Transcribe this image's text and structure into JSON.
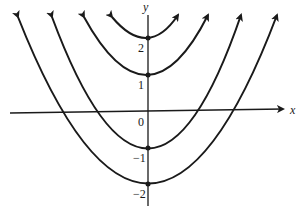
{
  "figure": {
    "axes": {
      "x_label": "x",
      "y_label": "y",
      "origin_label": "0",
      "y_ticks": [
        "2",
        "1",
        "−1",
        "−2"
      ]
    },
    "curves": [
      {
        "name": "parabola-vertex-2.5",
        "vertex": [
          0,
          2.5
        ],
        "opens": "up"
      },
      {
        "name": "parabola-vertex-1.5",
        "vertex": [
          0,
          1.5
        ],
        "opens": "up"
      },
      {
        "name": "parabola-vertex-neg-1",
        "vertex": [
          0,
          -1
        ],
        "opens": "up"
      },
      {
        "name": "parabola-vertex-neg-2",
        "vertex": [
          0,
          -2
        ],
        "opens": "up"
      }
    ],
    "line_color": "#1a1a1a"
  }
}
